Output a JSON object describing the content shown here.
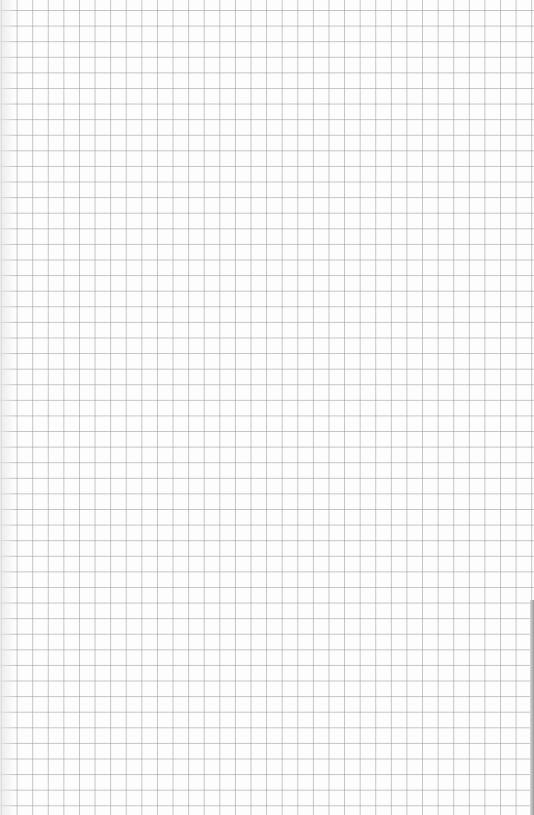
{
  "document": {
    "type": "graph-paper",
    "grid": {
      "cell_size_px": 15.6,
      "line_color": "#969696",
      "background_color": "#fdfdfd"
    }
  }
}
